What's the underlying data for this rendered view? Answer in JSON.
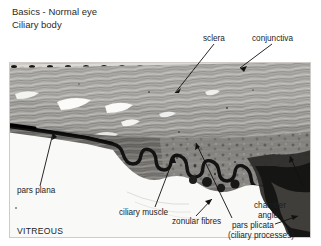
{
  "header": {
    "line1": "Basics - Normal eye",
    "line2": "Ciliary body"
  },
  "figure": {
    "type": "histology-micrograph",
    "stain_appearance": "grayscale light micrograph",
    "regions": [
      "conjunctiva",
      "sclera",
      "ciliary muscle",
      "pars plana",
      "pars plicata",
      "chamber angle",
      "zonular fibres",
      "vitreous"
    ]
  },
  "labels": {
    "sclera": "sclera",
    "conjunctiva": "conjunctiva",
    "pars_plana": "pars plana",
    "vitreous": "VITREOUS",
    "ciliary_muscle": "ciliary muscle",
    "zonular_fibres": "zonular fibres",
    "chamber_angle_line1": "chamber",
    "chamber_angle_line2": "angle",
    "pars_plicata": "pars plicata",
    "ciliary_processes": "(ciliary processes)"
  },
  "colors": {
    "background": "#ffffff",
    "text": "#1d1d1d",
    "title_text": "#2b2b2b",
    "leader_line": "#111111",
    "tissue_light": "#d8d6d2",
    "tissue_mid": "#9a9894",
    "tissue_dark": "#6b6a67",
    "pigment_dark": "#121212",
    "vitreous_white": "#f7f7f5"
  }
}
